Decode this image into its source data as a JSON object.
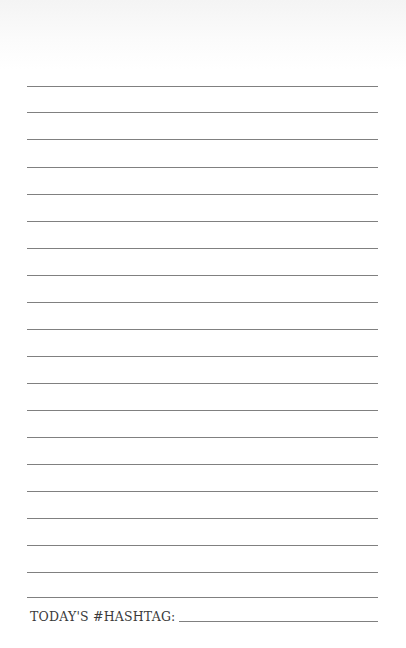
{
  "page": {
    "type": "lined-journal-page",
    "ruled_line_count": 20,
    "ruled_line_tops": [
      86,
      112,
      139,
      167,
      194,
      221,
      248,
      275,
      302,
      329,
      356,
      383,
      410,
      437,
      464,
      491,
      518,
      545,
      572,
      597
    ],
    "line_color": "#808080",
    "text_color": "#3a3a3a"
  },
  "footer": {
    "label": "TODAY'S #HASHTAG:"
  }
}
